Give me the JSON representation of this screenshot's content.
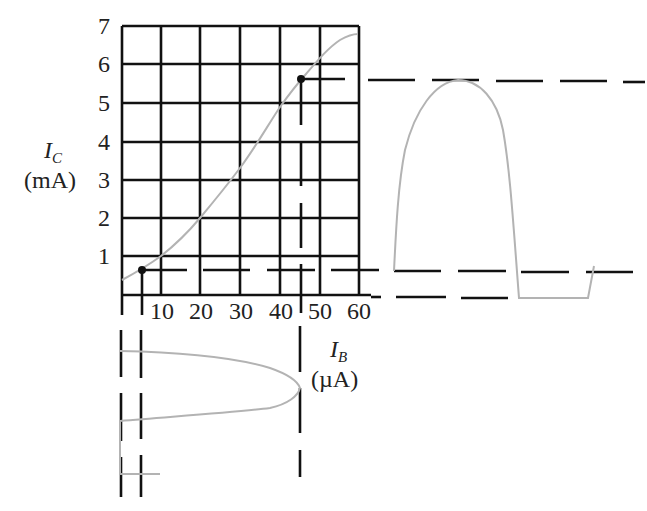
{
  "diagram": {
    "y_axis": {
      "symbol": "I",
      "subscript": "C",
      "unit": "(mA)",
      "ticks": [
        "1",
        "2",
        "3",
        "4",
        "5",
        "6",
        "7"
      ]
    },
    "x_axis": {
      "symbol": "I",
      "subscript": "B",
      "unit": "(µA)",
      "ticks": [
        "10",
        "20",
        "30",
        "40",
        "50",
        "60"
      ]
    },
    "colors": {
      "grid": "#111111",
      "curve": "#b3b3b3",
      "background": "#ffffff"
    },
    "operating_points": [
      {
        "ib_uA": 5,
        "ic_mA": 0.65
      },
      {
        "ib_uA": 45,
        "ic_mA": 5.6
      }
    ],
    "transfer_curve": {
      "ib_uA": [
        0,
        10,
        20,
        30,
        34,
        40,
        45,
        50,
        55,
        59
      ],
      "ic_mA": [
        0.4,
        1.0,
        2.0,
        3.3,
        3.9,
        4.9,
        5.6,
        6.1,
        6.6,
        6.8
      ]
    }
  }
}
